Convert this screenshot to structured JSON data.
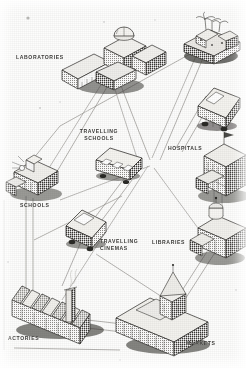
{
  "figure": {
    "type": "isometric-pictorial-diagram",
    "medium": "halftone-print-illustration",
    "ink_color": "#2b2a27",
    "paper_color": "#fdfdfc",
    "road_color": "#6e6c66"
  },
  "labels": [
    {
      "id": "laboratories",
      "text": "LABORATORIES",
      "x": 16,
      "y": 54,
      "align": "left"
    },
    {
      "id": "travelling-schools",
      "text": "TRAVELLING\nSCHOOLS",
      "x": 78,
      "y": 128,
      "align": "center"
    },
    {
      "id": "hospitals",
      "text": "HOSPITALS",
      "x": 168,
      "y": 145,
      "align": "left"
    },
    {
      "id": "schools",
      "text": "SCHOOLS",
      "x": 20,
      "y": 202,
      "align": "left"
    },
    {
      "id": "travelling-cinemas",
      "text": "TRAVELLING\nCINEMAS",
      "x": 100,
      "y": 238,
      "align": "left"
    },
    {
      "id": "libraries",
      "text": "LIBRARIES",
      "x": 152,
      "y": 239,
      "align": "left"
    },
    {
      "id": "factories",
      "text": "ACTORIES",
      "x": 8,
      "y": 335,
      "align": "left"
    },
    {
      "id": "markets",
      "text": "MARKETS",
      "x": 186,
      "y": 340,
      "align": "left"
    }
  ],
  "nodes": [
    {
      "id": "laboratories-building",
      "name": "laboratories-building",
      "cx": 108,
      "cy": 66
    },
    {
      "id": "domed-garden-building",
      "name": "domed-garden-building",
      "cx": 209,
      "cy": 40
    },
    {
      "id": "hospital-van",
      "name": "hospital-van",
      "cx": 216,
      "cy": 106
    },
    {
      "id": "hospital-building",
      "name": "hospital-building",
      "cx": 222,
      "cy": 168
    },
    {
      "id": "travelling-school-bus",
      "name": "travelling-school-bus",
      "cx": 116,
      "cy": 162
    },
    {
      "id": "school-building",
      "name": "school-building",
      "cx": 36,
      "cy": 180
    },
    {
      "id": "cinema-van",
      "name": "cinema-van",
      "cx": 84,
      "cy": 228
    },
    {
      "id": "library-building",
      "name": "library-building",
      "cx": 218,
      "cy": 232
    },
    {
      "id": "factory-building",
      "name": "factory-building",
      "cx": 48,
      "cy": 295
    },
    {
      "id": "market-building",
      "name": "market-building",
      "cx": 163,
      "cy": 318
    }
  ],
  "roads": [
    {
      "id": "road-labs-to-schools",
      "from": "laboratories-building",
      "to": "school-building"
    },
    {
      "id": "road-labs-to-centre",
      "from": "laboratories-building",
      "to": "travelling-school-bus"
    },
    {
      "id": "road-garden-to-centre",
      "from": "domed-garden-building",
      "to": "travelling-school-bus"
    },
    {
      "id": "road-garden-to-hospital",
      "from": "domed-garden-building",
      "to": "hospital-building"
    },
    {
      "id": "road-hospital-to-library",
      "from": "hospital-building",
      "to": "library-building"
    },
    {
      "id": "road-library-to-market",
      "from": "library-building",
      "to": "market-building"
    },
    {
      "id": "road-market-to-factory",
      "from": "market-building",
      "to": "factory-building"
    },
    {
      "id": "road-factory-to-schools",
      "from": "factory-building",
      "to": "school-building"
    },
    {
      "id": "road-centre-to-cinema",
      "from": "travelling-school-bus",
      "to": "cinema-van"
    },
    {
      "id": "road-cinema-to-factory",
      "from": "cinema-van",
      "to": "factory-building"
    }
  ]
}
